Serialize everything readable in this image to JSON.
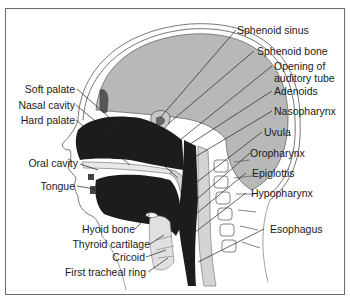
{
  "diagram": {
    "type": "anatomical-cross-section",
    "labels_left": [
      {
        "id": "soft-palate",
        "text": "Soft palate"
      },
      {
        "id": "nasal-cavity",
        "text": "Nasal cavity"
      },
      {
        "id": "hard-palate",
        "text": "Hard palate"
      },
      {
        "id": "oral-cavity",
        "text": "Oral cavity"
      },
      {
        "id": "tongue",
        "text": "Tongue"
      },
      {
        "id": "hyoid-bone",
        "text": "Hyoid bone"
      },
      {
        "id": "thyroid-cartilage",
        "text": "Thyroid cartilage"
      },
      {
        "id": "cricoid",
        "text": "Cricoid"
      },
      {
        "id": "first-tracheal-ring",
        "text": "First tracheal ring"
      }
    ],
    "labels_right": [
      {
        "id": "sphenoid-sinus",
        "text": "Sphenoid sinus"
      },
      {
        "id": "sphenoid-bone",
        "text": "Sphenoid bone"
      },
      {
        "id": "opening-auditory-tube-1",
        "text": "Opening of"
      },
      {
        "id": "opening-auditory-tube-2",
        "text": "auditory tube"
      },
      {
        "id": "adenoids",
        "text": "Adenoids"
      },
      {
        "id": "nasopharynx",
        "text": "Nasopharynx"
      },
      {
        "id": "uvula",
        "text": "Uvula"
      },
      {
        "id": "oropharynx",
        "text": "Oropharynx"
      },
      {
        "id": "epiglottis",
        "text": "Epiglottis"
      },
      {
        "id": "hypopharynx",
        "text": "Hypopharynx"
      },
      {
        "id": "esophagus",
        "text": "Esophagus"
      }
    ],
    "colors": {
      "brain": "#b8b8b8",
      "cavity": "#1c1c1c",
      "outline": "#555555",
      "skin": "#ffffff",
      "pharynx_wall": "#d4d4d4",
      "frame": "#6b6b6b"
    }
  }
}
